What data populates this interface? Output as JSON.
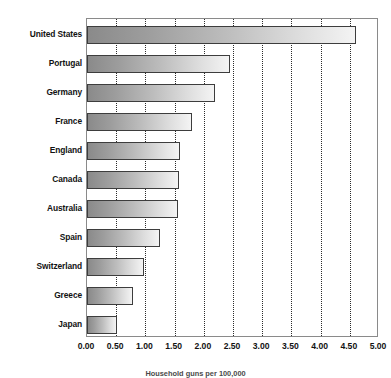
{
  "chart_data": {
    "type": "bar",
    "orientation": "horizontal",
    "title": "",
    "subtitle": "",
    "xlabel": "",
    "ylabel": "",
    "caption": "Household guns per 100,000",
    "categories": [
      "United States",
      "Portugal",
      "Germany",
      "France",
      "England",
      "Canada",
      "Australia",
      "Spain",
      "Switzerland",
      "Greece",
      "Japan"
    ],
    "values": [
      4.6,
      2.45,
      2.2,
      1.8,
      1.6,
      1.57,
      1.55,
      1.25,
      0.98,
      0.78,
      0.52
    ],
    "xlim": [
      0.0,
      5.0
    ],
    "xtick_step": 0.5,
    "xticks": [
      "0.00",
      "0.50",
      "1.00",
      "1.50",
      "2.00",
      "2.50",
      "3.00",
      "3.50",
      "4.00",
      "4.50",
      "5.00"
    ],
    "xtick_values": [
      0.0,
      0.5,
      1.0,
      1.5,
      2.0,
      2.5,
      3.0,
      3.5,
      4.0,
      4.5,
      5.0
    ],
    "grid": {
      "vertical": true,
      "horizontal": false,
      "style": "dotted"
    },
    "legend": {
      "visible": false,
      "position": "none"
    },
    "colors": {
      "bar_gradient_start": "#8a8a8a",
      "bar_gradient_end": "#f4f4f4",
      "bar_border": "#3d3d3d",
      "gridline": "#2b2b2b",
      "axis_border": "#8a8a8a",
      "background": "#ffffff",
      "text": "#121212"
    }
  }
}
